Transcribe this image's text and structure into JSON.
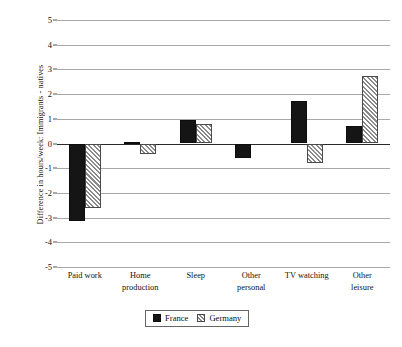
{
  "figure": {
    "y_axis_title": "Difference in hours/week: Immigrants - natives"
  },
  "legend": {
    "items": [
      {
        "label": "France",
        "pattern": "solid-black"
      },
      {
        "label": "Germany",
        "pattern": "diagonal-hatch"
      }
    ]
  },
  "chart_data": {
    "type": "bar",
    "title": "",
    "subtitle": "",
    "xlabel": "",
    "ylabel": "Difference in hours/week: Immigrants - natives",
    "ylim": [
      -5,
      5
    ],
    "yticks": [
      5,
      4,
      3,
      2,
      1,
      0,
      -1,
      -2,
      -3,
      -4,
      -5
    ],
    "ytick_labels": [
      "5",
      "4",
      "3",
      "2",
      "1",
      "0",
      "-1",
      "-2",
      "-3",
      "-4",
      "-5"
    ],
    "grid": true,
    "grid_axis": "y",
    "legend_position": "bottom-center",
    "orientation": "vertical",
    "categories": [
      "Paid work",
      "Home production",
      "Sleep",
      "Other personal",
      "TV watching",
      "Other leisure"
    ],
    "category_label_lines": [
      [
        "Paid work"
      ],
      [
        "Home",
        "production"
      ],
      [
        "Sleep"
      ],
      [
        "Other",
        "personal"
      ],
      [
        "TV watching"
      ],
      [
        "Other",
        "leisure"
      ]
    ],
    "series": [
      {
        "name": "France",
        "color": "#151515",
        "pattern": "solid",
        "values": [
          -3.15,
          0.06,
          0.95,
          -0.6,
          1.72,
          0.72
        ]
      },
      {
        "name": "Germany",
        "color": "#8a8a8a",
        "pattern": "diagonal-hatch",
        "values": [
          -2.62,
          -0.42,
          0.78,
          0.0,
          -0.8,
          2.73
        ]
      }
    ]
  }
}
